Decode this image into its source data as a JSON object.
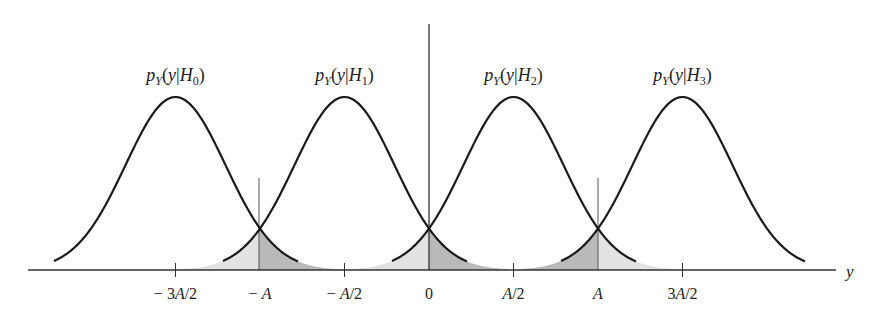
{
  "figure": {
    "axis_label": "y",
    "curves": [
      {
        "name": "H0",
        "label_main": "p",
        "label_sub": "Y",
        "label_arg": "(y|",
        "label_H": "H",
        "label_idx": "0",
        "label_close": ")",
        "center": "-3A/2"
      },
      {
        "name": "H1",
        "label_main": "p",
        "label_sub": "Y",
        "label_arg": "(y|",
        "label_H": "H",
        "label_idx": "1",
        "label_close": ")",
        "center": "-A/2"
      },
      {
        "name": "H2",
        "label_main": "p",
        "label_sub": "Y",
        "label_arg": "(y|",
        "label_H": "H",
        "label_idx": "2",
        "label_close": ")",
        "center": "A/2"
      },
      {
        "name": "H3",
        "label_main": "p",
        "label_sub": "Y",
        "label_arg": "(y|",
        "label_H": "H",
        "label_idx": "3",
        "label_close": ")",
        "center": "3A/2"
      }
    ],
    "ticks": [
      {
        "label": "− 3A/2",
        "value": -1.5
      },
      {
        "label": "− A",
        "value": -1.0
      },
      {
        "label": "− A/2",
        "value": -0.5
      },
      {
        "label": "0",
        "value": 0
      },
      {
        "label": "A/2",
        "value": 0.5
      },
      {
        "label": "A",
        "value": 1.0
      },
      {
        "label": "3A/2",
        "value": 1.5
      }
    ],
    "thresholds": [
      "-A",
      "0",
      "A"
    ],
    "colors": {
      "curve": "#1a1a1a",
      "axis": "#333333",
      "shade_light": "#e2e2e2",
      "shade_dark": "#b9b9b9"
    }
  }
}
